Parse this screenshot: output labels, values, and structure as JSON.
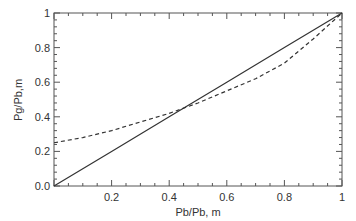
{
  "chart_data": {
    "type": "line",
    "title": "",
    "xlabel": "Pb/Pb, m",
    "ylabel": "Pg/Pb,m",
    "xlim": [
      0,
      1
    ],
    "ylim": [
      0,
      1
    ],
    "xticks": [
      "0.2",
      "0.4",
      "0.6",
      "0.8",
      "1"
    ],
    "yticks": [
      "0.0",
      "0.2",
      "0.4",
      "0.6",
      "0.8",
      "1"
    ],
    "grid": false,
    "legend": null,
    "series": [
      {
        "name": "solid line (y = x)",
        "style": "solid",
        "x": [
          0,
          0.2,
          0.4,
          0.6,
          0.8,
          1.0
        ],
        "y": [
          0,
          0.2,
          0.4,
          0.6,
          0.8,
          1.0
        ]
      },
      {
        "name": "dashed curve",
        "style": "dashed",
        "x": [
          0,
          0.1,
          0.2,
          0.3,
          0.4,
          0.5,
          0.6,
          0.7,
          0.8,
          0.9,
          1.0
        ],
        "y": [
          0.25,
          0.28,
          0.32,
          0.37,
          0.42,
          0.48,
          0.55,
          0.62,
          0.71,
          0.85,
          1.0
        ]
      }
    ]
  }
}
